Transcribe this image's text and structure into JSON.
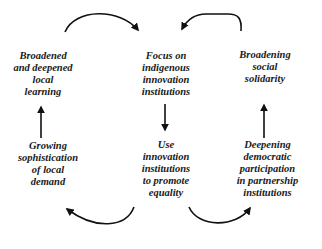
{
  "diagram": {
    "type": "cycle",
    "nodes": [
      {
        "id": "broadened-learning",
        "label": "Broadened\nand deepened\nlocal\nlearning",
        "position": "top-left"
      },
      {
        "id": "focus-institutions",
        "label": "Focus on\nindigenous\ninnovation\ninstitutions",
        "position": "top-center"
      },
      {
        "id": "broadening-solidarity",
        "label": "Broadening\nsocial\nsolidarity",
        "position": "top-right"
      },
      {
        "id": "growing-demand",
        "label": "Growing\nsophistication\nof local\ndemand",
        "position": "bottom-left"
      },
      {
        "id": "use-institutions",
        "label": "Use\ninnovation\ninstitutions\nto promote\nequality",
        "position": "bottom-center"
      },
      {
        "id": "deepening-participation",
        "label": "Deepening\ndemocratic\nparticipation\nin partnership\ninstitutions",
        "position": "bottom-right"
      }
    ],
    "edges": [
      {
        "from": "broadened-learning",
        "to": "focus-institutions",
        "style": "curved-over"
      },
      {
        "from": "broadening-solidarity",
        "to": "focus-institutions",
        "style": "curved-over"
      },
      {
        "from": "focus-institutions",
        "to": "use-institutions",
        "style": "straight-down"
      },
      {
        "from": "use-institutions",
        "to": "growing-demand",
        "style": "curved-under"
      },
      {
        "from": "use-institutions",
        "to": "deepening-participation",
        "style": "curved-under"
      },
      {
        "from": "growing-demand",
        "to": "broadened-learning",
        "style": "straight-up"
      },
      {
        "from": "deepening-participation",
        "to": "broadening-solidarity",
        "style": "straight-up"
      }
    ],
    "colors": {
      "text": "#1a1a1a",
      "arrow": "#111111",
      "background": "#ffffff"
    }
  }
}
